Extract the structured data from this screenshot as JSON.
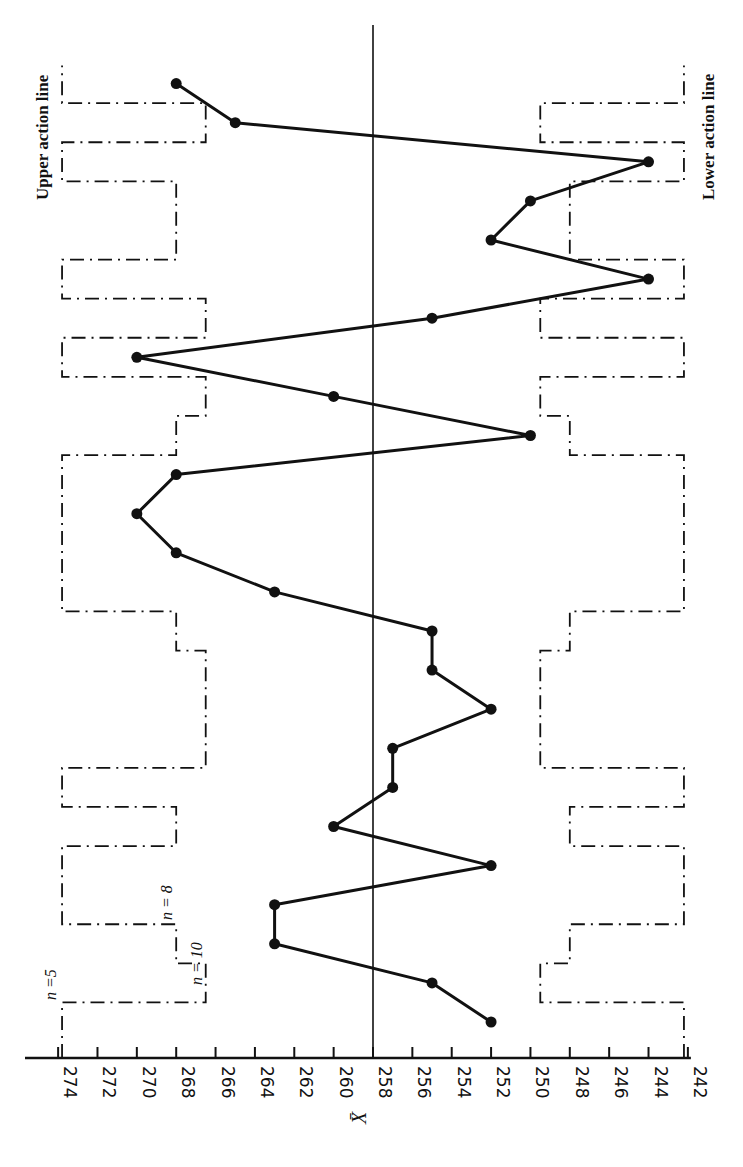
{
  "chart_data": {
    "type": "line",
    "title": "",
    "orientation": "rotated-90-ccw",
    "xlabel": "Sample number",
    "ylabel": "X̄",
    "ylim": [
      242,
      274
    ],
    "center_line": 258,
    "y_ticks": [
      274,
      272,
      270,
      268,
      266,
      264,
      262,
      260,
      258,
      256,
      254,
      252,
      250,
      248,
      246,
      244,
      242
    ],
    "x": [
      1,
      2,
      3,
      4,
      5,
      6,
      7,
      8,
      9,
      10,
      11,
      12,
      13,
      14,
      15,
      16,
      17,
      18,
      19,
      20,
      21,
      22,
      23,
      24,
      25
    ],
    "series": [
      {
        "name": "Sample mean X̄",
        "values": [
          252,
          255,
          263,
          263,
          252,
          260,
          257,
          257,
          252,
          255,
          255,
          263,
          268,
          270,
          268,
          250,
          260,
          270,
          255,
          244,
          252,
          250,
          244,
          265,
          268
        ]
      }
    ],
    "sample_sizes": [
      5,
      10,
      8,
      5,
      5,
      8,
      5,
      10,
      10,
      10,
      8,
      5,
      5,
      5,
      5,
      8,
      10,
      5,
      10,
      5,
      8,
      8,
      5,
      10,
      5
    ],
    "action_limits": {
      "n=5": {
        "upper": 273.8,
        "lower": 242.2
      },
      "n=8": {
        "upper": 268.0,
        "lower": 248.0
      },
      "n=10": {
        "upper": 266.5,
        "lower": 249.5
      }
    },
    "annotations": [
      "Upper action line",
      "Lower action line",
      "n =5",
      "n = 8",
      "n = 10"
    ],
    "grid": false,
    "legend": null
  },
  "labels": {
    "upper": "Upper action line",
    "lower": "Lower action line",
    "n5": "n =5",
    "n8": "n = 8",
    "n10": "n = 10",
    "axis_title": "X̄"
  }
}
